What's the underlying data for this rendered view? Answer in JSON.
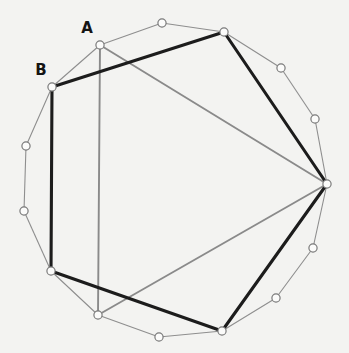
{
  "figure": {
    "background_color": "#f3f3f1",
    "width": 349,
    "height": 353,
    "colors": {
      "outer_ring_stroke": "#8e8e8e",
      "gray_chord_stroke": "#8a8a8a",
      "black_edge_stroke": "#1c1c1c",
      "vertex_fill": "#fbfbfa",
      "vertex_stroke": "#7a7a7a",
      "label_color": "#141414"
    }
  },
  "labels": [
    {
      "name": "label-A",
      "text": "A",
      "x": 87,
      "y": 28
    },
    {
      "name": "label-B",
      "text": "B",
      "x": 41,
      "y": 70
    }
  ],
  "chart_data": {
    "type": "scatter",
    "xlabel": "",
    "ylabel": "",
    "grid": false,
    "legend": "none",
    "xlim": [
      0,
      349
    ],
    "ylim": [
      0,
      353
    ],
    "vertices": [
      {
        "id": "v0",
        "label": "A",
        "x": 100,
        "y": 45,
        "ring": "outer"
      },
      {
        "id": "v1",
        "label": "",
        "x": 162,
        "y": 23,
        "ring": "outer"
      },
      {
        "id": "v2",
        "label": "",
        "x": 224,
        "y": 32,
        "ring": "outer"
      },
      {
        "id": "v3",
        "label": "",
        "x": 281,
        "y": 68,
        "ring": "outer"
      },
      {
        "id": "v4",
        "label": "",
        "x": 315,
        "y": 119,
        "ring": "outer"
      },
      {
        "id": "v5",
        "label": "",
        "x": 327,
        "y": 184,
        "ring": "outer"
      },
      {
        "id": "v6",
        "label": "",
        "x": 313,
        "y": 248,
        "ring": "outer"
      },
      {
        "id": "v7",
        "label": "",
        "x": 276,
        "y": 298,
        "ring": "outer"
      },
      {
        "id": "v8",
        "label": "",
        "x": 222,
        "y": 331,
        "ring": "outer"
      },
      {
        "id": "v9",
        "label": "",
        "x": 159,
        "y": 337,
        "ring": "outer"
      },
      {
        "id": "v10",
        "label": "",
        "x": 98,
        "y": 315,
        "ring": "outer"
      },
      {
        "id": "v11",
        "label": "",
        "x": 51,
        "y": 271,
        "ring": "outer"
      },
      {
        "id": "v12",
        "label": "",
        "x": 24,
        "y": 211,
        "ring": "outer"
      },
      {
        "id": "v13",
        "label": "",
        "x": 26,
        "y": 146,
        "ring": "outer"
      },
      {
        "id": "v14",
        "label": "B",
        "x": 52,
        "y": 87,
        "ring": "outer"
      }
    ],
    "outer_ring_edges": [
      [
        "v14",
        "v0"
      ],
      [
        "v0",
        "v1"
      ],
      [
        "v1",
        "v2"
      ],
      [
        "v2",
        "v3"
      ],
      [
        "v3",
        "v4"
      ],
      [
        "v4",
        "v5"
      ],
      [
        "v5",
        "v6"
      ],
      [
        "v6",
        "v7"
      ],
      [
        "v7",
        "v8"
      ],
      [
        "v8",
        "v9"
      ],
      [
        "v9",
        "v10"
      ],
      [
        "v10",
        "v11"
      ],
      [
        "v11",
        "v12"
      ],
      [
        "v12",
        "v13"
      ],
      [
        "v13",
        "v14"
      ]
    ],
    "black_heptagon_edges": [
      [
        "v14",
        "v2"
      ],
      [
        "v2",
        "v5"
      ],
      [
        "v5",
        "v8"
      ],
      [
        "v8",
        "v11"
      ],
      [
        "v11",
        "v14"
      ]
    ],
    "gray_chords": [
      [
        "v0",
        "v5"
      ],
      [
        "v5",
        "v10"
      ],
      [
        "v0",
        "v10"
      ]
    ]
  }
}
